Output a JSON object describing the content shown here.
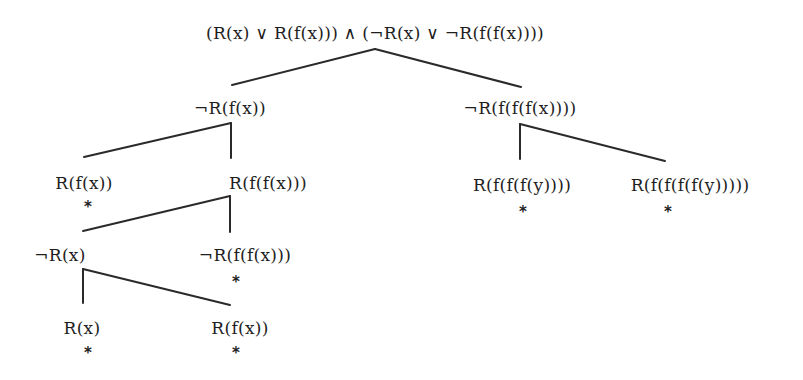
{
  "diagram": {
    "type": "resolution-refutation-tree",
    "closed_marker": "*",
    "root": {
      "label": "(R(x) ∨ R(f(x))) ∧ (¬R(x) ∨ ¬R(f(f(x))))"
    },
    "nodes": [
      {
        "id": "n1",
        "label": "¬R(f(x))",
        "parent": "root",
        "closed": false
      },
      {
        "id": "n2",
        "label": "¬R(f(f(f(x))))",
        "parent": "root",
        "closed": false
      },
      {
        "id": "n3",
        "label": "R(f(x))",
        "parent": "n1",
        "closed": true
      },
      {
        "id": "n4",
        "label": "R(f(f(x)))",
        "parent": "n1",
        "closed": false
      },
      {
        "id": "n5",
        "label": "R(f(f(f(y))))",
        "parent": "n2",
        "closed": true
      },
      {
        "id": "n6",
        "label": "R(f(f(f(f(y)))))",
        "parent": "n2",
        "closed": true
      },
      {
        "id": "n7",
        "label": "¬R(x)",
        "parent": "n4",
        "closed": false
      },
      {
        "id": "n8",
        "label": "¬R(f(f(x)))",
        "parent": "n4",
        "closed": true
      },
      {
        "id": "n9",
        "label": "R(x)",
        "parent": "n7",
        "closed": true
      },
      {
        "id": "n10",
        "label": "R(f(x))",
        "parent": "n7",
        "closed": true
      }
    ]
  }
}
